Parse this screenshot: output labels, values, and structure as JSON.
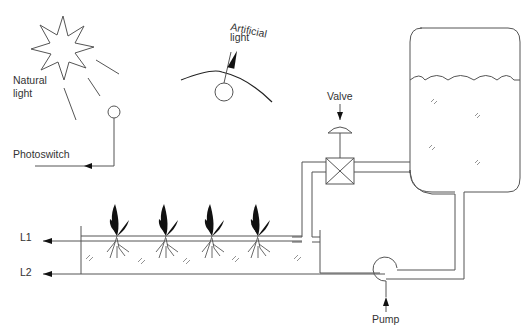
{
  "diagram": {
    "type": "hydroponic-control-schematic",
    "labels": {
      "natural_light_line1": "Natural",
      "natural_light_line2": "light",
      "artificial_light_line1": "Artificial",
      "artificial_light_line2": "light",
      "photoswitch": "Photoswitch",
      "valve": "Valve",
      "pump": "Pump",
      "level1": "L1",
      "level2": "L2"
    },
    "components": [
      {
        "id": "sun",
        "kind": "natural-light-source"
      },
      {
        "id": "photoswitch",
        "kind": "light-sensor"
      },
      {
        "id": "lamp",
        "kind": "artificial-light"
      },
      {
        "id": "valve",
        "kind": "control-valve"
      },
      {
        "id": "tank",
        "kind": "nutrient-reservoir"
      },
      {
        "id": "trough",
        "kind": "growing-channel"
      },
      {
        "id": "pump",
        "kind": "circulation-pump"
      }
    ],
    "plants": [
      {
        "x": 117
      },
      {
        "x": 166
      },
      {
        "x": 212
      },
      {
        "x": 258
      }
    ],
    "colors": {
      "line": "#555555",
      "plant": "#111111",
      "text": "#333333"
    }
  }
}
